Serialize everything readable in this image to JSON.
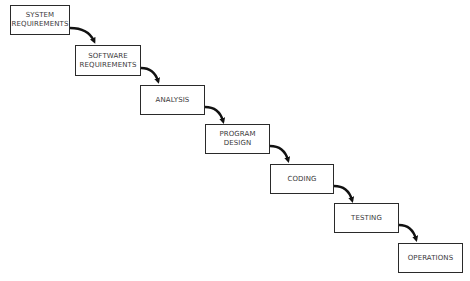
{
  "diagram": {
    "type": "waterfall-process",
    "steps": [
      {
        "label": "SYSTEM\nREQUIREMENTS"
      },
      {
        "label": "SOFTWARE\nREQUIREMENTS"
      },
      {
        "label": "ANALYSIS"
      },
      {
        "label": "PROGRAM\nDESIGN"
      },
      {
        "label": "CODING"
      },
      {
        "label": "TESTING"
      },
      {
        "label": "OPERATIONS"
      }
    ],
    "connectors": [
      {
        "from": 0,
        "to": 1
      },
      {
        "from": 1,
        "to": 2
      },
      {
        "from": 2,
        "to": 3
      },
      {
        "from": 3,
        "to": 4
      },
      {
        "from": 4,
        "to": 5
      },
      {
        "from": 5,
        "to": 6
      }
    ],
    "colors": {
      "stroke": "#2a2a2a",
      "arrow": "#111111",
      "text": "#3a3a3a",
      "background": "#ffffff"
    }
  }
}
